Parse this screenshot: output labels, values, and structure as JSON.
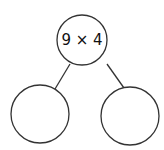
{
  "diagram": {
    "type": "number-bond",
    "whole": {
      "label": "9 × 4"
    },
    "parts": [
      {
        "label": ""
      },
      {
        "label": ""
      }
    ],
    "colors": {
      "stroke": "#333333",
      "background": "#ffffff"
    }
  }
}
